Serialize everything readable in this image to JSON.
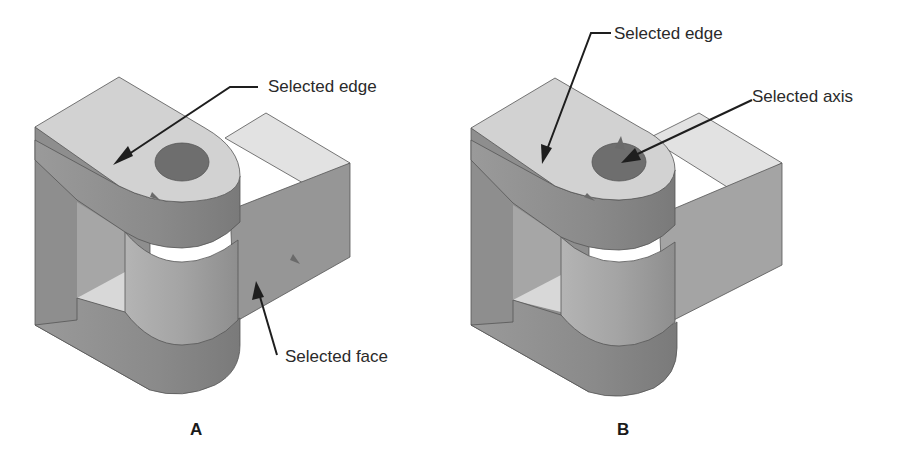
{
  "figures": [
    {
      "id": "A",
      "panel_label": "A",
      "callouts": {
        "edge": "Selected edge",
        "face": "Selected face"
      }
    },
    {
      "id": "B",
      "panel_label": "B",
      "callouts": {
        "edge": "Selected edge",
        "axis": "Selected axis"
      }
    }
  ],
  "colors": {
    "background": "#ffffff",
    "top_face": "#d6d6d6",
    "light_face": "#e4e4e4",
    "side_face": "#8c8c8c",
    "front_face": "#9e9e9e",
    "cylinder": "#a8a8a8",
    "hole": "#6e6e6e",
    "arrow": "#1e1e1e",
    "text": "#2a2a2a"
  }
}
